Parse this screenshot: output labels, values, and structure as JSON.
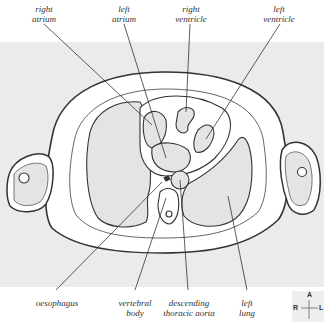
{
  "diagram": {
    "colors": {
      "background_band": "#ebebeb",
      "outline": "#333333",
      "leader": "#333333",
      "fill_organ": "#e4e4e4",
      "fill_tissue": "#ffffff"
    },
    "top_labels": [
      {
        "id": "right-atrium",
        "line1": "right",
        "line2": "atrium"
      },
      {
        "id": "left-atrium",
        "line1": "left",
        "line2": "atrium"
      },
      {
        "id": "right-ventricle",
        "line1": "right",
        "line2": "ventricle"
      },
      {
        "id": "left-ventricle",
        "line1": "left",
        "line2": "ventricle"
      }
    ],
    "bottom_labels": [
      {
        "id": "oesophagus",
        "line1": "oesophagus",
        "line2": ""
      },
      {
        "id": "vertebral-body",
        "line1": "vertebral",
        "line2": "body"
      },
      {
        "id": "descending-thoracic-aorta",
        "line1": "descending",
        "line2": "thoracic aorta"
      },
      {
        "id": "left-lung",
        "line1": "left",
        "line2": "lung"
      }
    ],
    "compass": {
      "anterior": "A",
      "right": "R",
      "left": "L"
    }
  }
}
